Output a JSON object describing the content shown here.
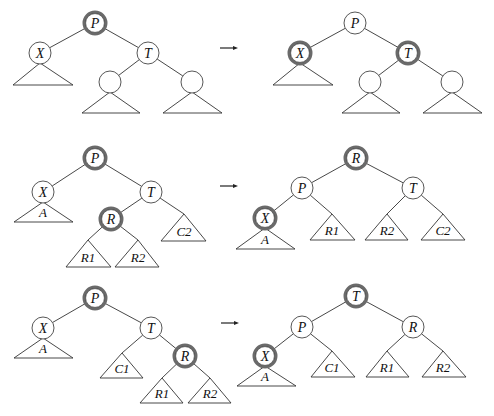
{
  "diagram": {
    "arrow_symbol": "→",
    "rows": [
      {
        "before": {
          "nodes": [
            {
              "id": "P",
              "label": "P",
              "x": 95,
              "y": 23,
              "highlight": true
            },
            {
              "id": "X",
              "label": "X",
              "x": 40,
              "y": 53,
              "highlight": false
            },
            {
              "id": "T",
              "label": "T",
              "x": 148,
              "y": 53,
              "highlight": false
            },
            {
              "id": "T1",
              "label": "",
              "x": 110,
              "y": 82,
              "highlight": false
            },
            {
              "id": "T2",
              "label": "",
              "x": 192,
              "y": 82,
              "highlight": false
            }
          ],
          "edges": [
            [
              "P",
              "X"
            ],
            [
              "P",
              "T"
            ],
            [
              "T",
              "T1"
            ],
            [
              "T",
              "T2"
            ]
          ],
          "subtrees": [
            {
              "label": "",
              "apex": [
                40,
                63
              ],
              "left": 13,
              "right": 73,
              "base": 85
            },
            {
              "label": "",
              "apex": [
                110,
                92
              ],
              "left": 82,
              "right": 140,
              "base": 113
            },
            {
              "label": "",
              "apex": [
                192,
                92
              ],
              "left": 163,
              "right": 222,
              "base": 113
            }
          ]
        },
        "arrow": {
          "x1": 220,
          "x2": 238,
          "y": 48
        },
        "after": {
          "nodes": [
            {
              "id": "P",
              "label": "P",
              "x": 355,
              "y": 23,
              "highlight": false
            },
            {
              "id": "X",
              "label": "X",
              "x": 300,
              "y": 53,
              "highlight": true
            },
            {
              "id": "T",
              "label": "T",
              "x": 408,
              "y": 53,
              "highlight": true
            },
            {
              "id": "T1",
              "label": "",
              "x": 370,
              "y": 82,
              "highlight": false
            },
            {
              "id": "T2",
              "label": "",
              "x": 452,
              "y": 82,
              "highlight": false
            }
          ],
          "edges": [
            [
              "P",
              "X"
            ],
            [
              "P",
              "T"
            ],
            [
              "T",
              "T1"
            ],
            [
              "T",
              "T2"
            ]
          ],
          "subtrees": [
            {
              "label": "",
              "apex": [
                300,
                63
              ],
              "left": 273,
              "right": 333,
              "base": 85
            },
            {
              "label": "",
              "apex": [
                370,
                92
              ],
              "left": 342,
              "right": 400,
              "base": 113
            },
            {
              "label": "",
              "apex": [
                452,
                92
              ],
              "left": 423,
              "right": 482,
              "base": 113
            }
          ]
        }
      },
      {
        "before": {
          "nodes": [
            {
              "id": "P",
              "label": "P",
              "x": 95,
              "y": 158,
              "highlight": true
            },
            {
              "id": "X",
              "label": "X",
              "x": 43,
              "y": 192,
              "highlight": false
            },
            {
              "id": "T",
              "label": "T",
              "x": 151,
              "y": 192,
              "highlight": false
            },
            {
              "id": "R",
              "label": "R",
              "x": 111,
              "y": 219,
              "highlight": true
            }
          ],
          "edges": [
            [
              "P",
              "X"
            ],
            [
              "P",
              "T"
            ],
            [
              "T",
              "R"
            ],
            [
              "T",
              "C2"
            ],
            [
              "R",
              "R1"
            ],
            [
              "R",
              "R2"
            ]
          ],
          "subtrees": [
            {
              "id": "A",
              "label": "A",
              "apex": [
                43,
                202
              ],
              "left": 14,
              "right": 73,
              "base": 222
            },
            {
              "id": "R1",
              "label": "R1",
              "apex": [
                88,
                240
              ],
              "left": 66,
              "right": 111,
              "base": 267
            },
            {
              "id": "R2",
              "label": "R2",
              "apex": [
                138,
                240
              ],
              "left": 115,
              "right": 159,
              "base": 267
            },
            {
              "id": "C2",
              "label": "C2",
              "apex": [
                184,
                214
              ],
              "left": 161,
              "right": 206,
              "base": 241
            }
          ]
        },
        "arrow": {
          "x1": 220,
          "x2": 238,
          "y": 186
        },
        "after": {
          "nodes": [
            {
              "id": "R",
              "label": "R",
              "x": 356,
              "y": 158,
              "highlight": true
            },
            {
              "id": "P",
              "label": "P",
              "x": 302,
              "y": 188,
              "highlight": false
            },
            {
              "id": "T",
              "label": "T",
              "x": 413,
              "y": 188,
              "highlight": false
            },
            {
              "id": "X",
              "label": "X",
              "x": 265,
              "y": 218,
              "highlight": true
            }
          ],
          "edges": [
            [
              "R",
              "P"
            ],
            [
              "R",
              "T"
            ],
            [
              "P",
              "X"
            ],
            [
              "P",
              "R1"
            ],
            [
              "T",
              "R2"
            ],
            [
              "T",
              "C2"
            ]
          ],
          "subtrees": [
            {
              "id": "A",
              "label": "A",
              "apex": [
                265,
                228
              ],
              "left": 236,
              "right": 295,
              "base": 249
            },
            {
              "id": "R1",
              "label": "R1",
              "apex": [
                332,
                214
              ],
              "left": 310,
              "right": 355,
              "base": 240
            },
            {
              "id": "R2",
              "label": "R2",
              "apex": [
                387,
                214
              ],
              "left": 365,
              "right": 408,
              "base": 240
            },
            {
              "id": "C2",
              "label": "C2",
              "apex": [
                443,
                214
              ],
              "left": 421,
              "right": 465,
              "base": 240
            }
          ]
        }
      },
      {
        "before": {
          "nodes": [
            {
              "id": "P",
              "label": "P",
              "x": 95,
              "y": 298,
              "highlight": true
            },
            {
              "id": "X",
              "label": "X",
              "x": 43,
              "y": 328,
              "highlight": false
            },
            {
              "id": "T",
              "label": "T",
              "x": 151,
              "y": 328,
              "highlight": false
            },
            {
              "id": "R",
              "label": "R",
              "x": 185,
              "y": 356,
              "highlight": true
            }
          ],
          "edges": [
            [
              "P",
              "X"
            ],
            [
              "P",
              "T"
            ],
            [
              "T",
              "C1"
            ],
            [
              "T",
              "R"
            ],
            [
              "R",
              "R1"
            ],
            [
              "R",
              "R2"
            ]
          ],
          "subtrees": [
            {
              "id": "A",
              "label": "A",
              "apex": [
                43,
                338
              ],
              "left": 14,
              "right": 73,
              "base": 358
            },
            {
              "id": "C1",
              "label": "C1",
              "apex": [
                122,
                353
              ],
              "left": 100,
              "right": 143,
              "base": 378
            },
            {
              "id": "R1",
              "label": "R1",
              "apex": [
                162,
                378
              ],
              "left": 140,
              "right": 183,
              "base": 403
            },
            {
              "id": "R2",
              "label": "R2",
              "apex": [
                210,
                378
              ],
              "left": 188,
              "right": 231,
              "base": 403
            }
          ]
        },
        "arrow": {
          "x1": 221,
          "x2": 239,
          "y": 323
        },
        "after": {
          "nodes": [
            {
              "id": "T",
              "label": "T",
              "x": 356,
              "y": 296,
              "highlight": true
            },
            {
              "id": "P",
              "label": "P",
              "x": 302,
              "y": 327,
              "highlight": false
            },
            {
              "id": "R",
              "label": "R",
              "x": 413,
              "y": 327,
              "highlight": false
            },
            {
              "id": "X",
              "label": "X",
              "x": 265,
              "y": 356,
              "highlight": true
            }
          ],
          "edges": [
            [
              "T",
              "P"
            ],
            [
              "T",
              "R"
            ],
            [
              "P",
              "X"
            ],
            [
              "P",
              "C1"
            ],
            [
              "R",
              "R1"
            ],
            [
              "R",
              "R2"
            ]
          ],
          "subtrees": [
            {
              "id": "A",
              "label": "A",
              "apex": [
                265,
                366
              ],
              "left": 237,
              "right": 296,
              "base": 386
            },
            {
              "id": "C1",
              "label": "C1",
              "apex": [
                332,
                351
              ],
              "left": 311,
              "right": 355,
              "base": 377
            },
            {
              "id": "R1",
              "label": "R1",
              "apex": [
                387,
                351
              ],
              "left": 366,
              "right": 409,
              "base": 377
            },
            {
              "id": "R2",
              "label": "R2",
              "apex": [
                443,
                351
              ],
              "left": 422,
              "right": 466,
              "base": 377
            }
          ]
        }
      }
    ]
  }
}
